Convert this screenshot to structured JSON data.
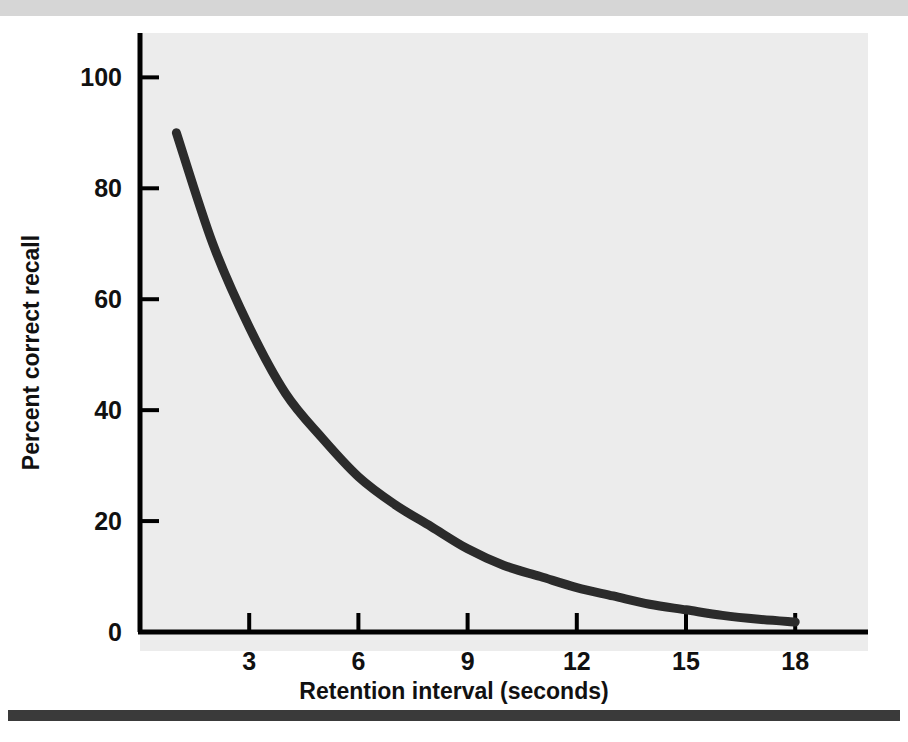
{
  "figure": {
    "top_rule_color": "#d6d6d6",
    "bottom_rule_color": "#3a3a3a",
    "plot_background": "#ececec",
    "axis_color": "#000000",
    "curve_color": "#2b2b2b"
  },
  "chart_data": {
    "type": "line",
    "title": "",
    "subtitle": "",
    "xlabel": "Retention interval (seconds)",
    "ylabel": "Percent correct recall",
    "xlim": [
      0,
      20
    ],
    "ylim": [
      0,
      108
    ],
    "grid": false,
    "legend": null,
    "xticks": [
      3,
      6,
      9,
      12,
      15,
      18
    ],
    "xtick_labels": [
      "3",
      "6",
      "9",
      "12",
      "15",
      "18"
    ],
    "yticks": [
      20,
      40,
      60,
      80,
      100
    ],
    "ytick_labels": [
      "20",
      "40",
      "60",
      "80",
      "100"
    ],
    "y_origin_label": "0",
    "annotations": [],
    "series": [
      {
        "name": "Percent correct recall",
        "x": [
          1,
          2,
          3,
          4,
          5,
          6,
          7,
          8,
          9,
          10,
          11,
          12,
          13,
          14,
          15,
          16,
          17,
          18
        ],
        "values": [
          90,
          70,
          55,
          43,
          35,
          28,
          23,
          19,
          15,
          12,
          10,
          8,
          6.5,
          5,
          4,
          3,
          2.3,
          1.8
        ]
      }
    ]
  }
}
